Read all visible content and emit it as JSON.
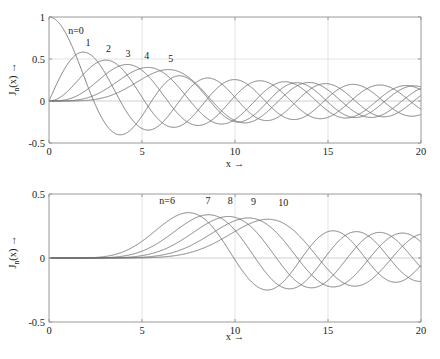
{
  "figure": {
    "title": "",
    "background": "#ffffff",
    "curve_color": "#6e6e6e",
    "axis_color": "#9a9a9a",
    "grid_color": "#dcdcdc"
  },
  "axis_titles": {
    "x": "x →",
    "y_prefix": "J",
    "y_sub": "n",
    "y_suffix": "(x) →"
  },
  "chart_data": [
    {
      "type": "line",
      "title": "",
      "xlabel": "x →",
      "ylabel": "J_n(x) →",
      "xlim": [
        0,
        20
      ],
      "ylim": [
        -0.5,
        1
      ],
      "xticks": [
        0,
        5,
        10,
        15,
        20
      ],
      "xticklabels": [
        "0",
        "5",
        "10",
        "15",
        "20"
      ],
      "yticks": [
        -0.5,
        0,
        0.5,
        1
      ],
      "yticklabels": [
        "-0.5",
        "0",
        "0.5",
        "1"
      ],
      "grid": true,
      "legend_position": "inline-annotations",
      "annotations": [
        {
          "text": "n=0",
          "x": 1.45,
          "y": 0.8
        },
        {
          "text": "1",
          "x": 2.1,
          "y": 0.655
        },
        {
          "text": "2",
          "x": 3.2,
          "y": 0.585
        },
        {
          "text": "3",
          "x": 4.25,
          "y": 0.525
        },
        {
          "text": "4",
          "x": 5.25,
          "y": 0.5
        },
        {
          "text": "5",
          "x": 6.55,
          "y": 0.47
        }
      ],
      "series": [
        {
          "name": "J0",
          "order": 0
        },
        {
          "name": "J1",
          "order": 1
        },
        {
          "name": "J2",
          "order": 2
        },
        {
          "name": "J3",
          "order": 3
        },
        {
          "name": "J4",
          "order": 4
        },
        {
          "name": "J5",
          "order": 5
        }
      ]
    },
    {
      "type": "line",
      "title": "",
      "xlabel": "x →",
      "ylabel": "J_n(x) →",
      "xlim": [
        0,
        20
      ],
      "ylim": [
        -0.5,
        0.5
      ],
      "xticks": [
        0,
        5,
        10,
        15,
        20
      ],
      "xticklabels": [
        "0",
        "5",
        "10",
        "15",
        "20"
      ],
      "yticks": [
        -0.5,
        0,
        0.5
      ],
      "yticklabels": [
        "-0.5",
        "0",
        "0.5"
      ],
      "grid": true,
      "legend_position": "inline-annotations",
      "annotations": [
        {
          "text": "n=6",
          "x": 6.35,
          "y": 0.425
        },
        {
          "text": "7",
          "x": 8.55,
          "y": 0.425
        },
        {
          "text": "8",
          "x": 9.75,
          "y": 0.42
        },
        {
          "text": "9",
          "x": 11.0,
          "y": 0.415
        },
        {
          "text": "10",
          "x": 12.6,
          "y": 0.405
        }
      ],
      "series": [
        {
          "name": "J6",
          "order": 6
        },
        {
          "name": "J7",
          "order": 7
        },
        {
          "name": "J8",
          "order": 8
        },
        {
          "name": "J9",
          "order": 9
        },
        {
          "name": "J10",
          "order": 10
        }
      ]
    }
  ]
}
